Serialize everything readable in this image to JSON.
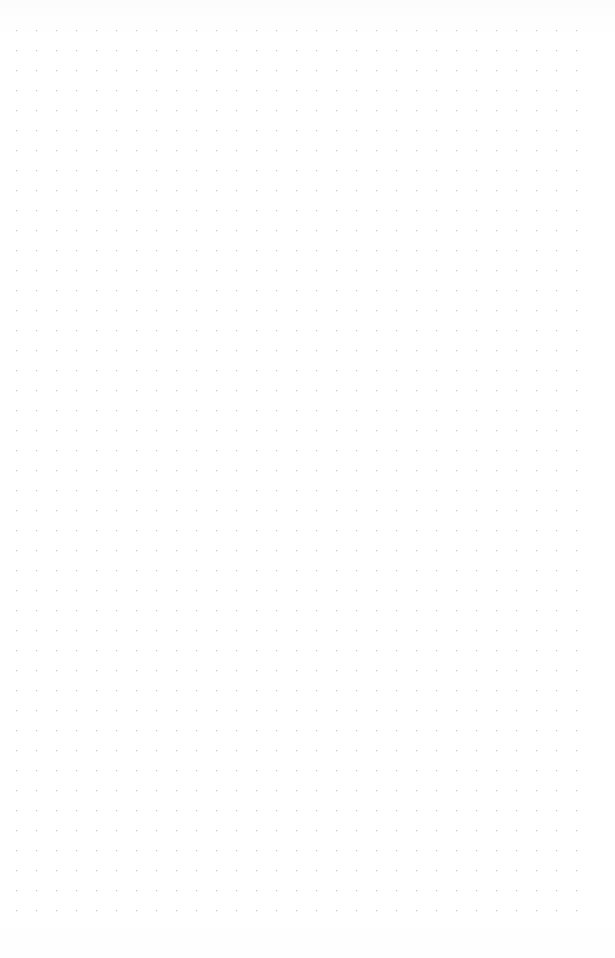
{
  "page": {
    "width": 615,
    "height": 958,
    "background_color": "#ffffff",
    "surface_type": "dot-grid-paper",
    "content_text": "",
    "description": "Blank dotted grid notebook page with no written content"
  },
  "dot_grid": {
    "dot_color": "#afafb6",
    "dot_diameter_px": 1.3,
    "spacing_x_px": 20,
    "spacing_y_px": 20,
    "origin_x_px": 17,
    "origin_y_px": 31,
    "columns": 30,
    "rows": 45,
    "first_dot_x_px": 17,
    "first_dot_y_px": 31,
    "last_dot_x_px": 577,
    "last_dot_y_px": 922,
    "margin_top_px": 31,
    "margin_bottom_px": 36,
    "margin_left_px": 17,
    "margin_right_px": 38,
    "left_edge_partial_column_x_px": -3,
    "opacity": 0.9
  },
  "annotations": {
    "items": []
  }
}
